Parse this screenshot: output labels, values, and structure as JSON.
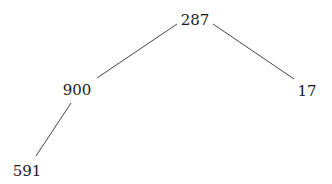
{
  "diagram": {
    "type": "tree",
    "line_color": "#444444",
    "text_color": "#1a1a1a",
    "nodes": [
      {
        "id": "n287",
        "label": "287",
        "x": 195,
        "y": 20
      },
      {
        "id": "n900",
        "label": "900",
        "x": 77,
        "y": 90
      },
      {
        "id": "n17",
        "label": "17",
        "x": 307,
        "y": 91
      },
      {
        "id": "n591",
        "label": "591",
        "x": 27,
        "y": 171
      }
    ],
    "edges": [
      {
        "from": "n287",
        "to": "n900",
        "x1": 177,
        "y1": 24,
        "x2": 97,
        "y2": 78
      },
      {
        "from": "n287",
        "to": "n17",
        "x1": 213,
        "y1": 24,
        "x2": 294,
        "y2": 79
      },
      {
        "from": "n900",
        "to": "n591",
        "x1": 71,
        "y1": 103,
        "x2": 36,
        "y2": 156
      }
    ]
  }
}
